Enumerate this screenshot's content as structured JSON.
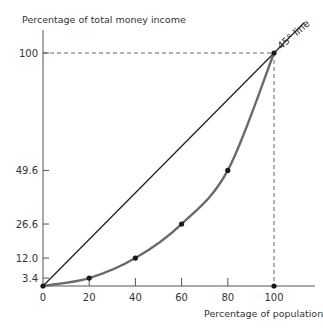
{
  "chart_data": {
    "type": "line",
    "title": "",
    "ylabel": "Percentage of total money income",
    "xlabel": "Percentage of population",
    "xlim": [
      0,
      100
    ],
    "ylim": [
      0,
      100
    ],
    "x_ticks": [
      0,
      20,
      40,
      60,
      80,
      100
    ],
    "y_ticks": [
      3.4,
      12.0,
      26.6,
      49.6,
      100
    ],
    "y_tick_labels": [
      "3.4",
      "12.0",
      "26.6",
      "49.6",
      "100"
    ],
    "x_tick_labels": [
      "0",
      "20",
      "40",
      "60",
      "80",
      "100"
    ],
    "grid": false,
    "series": [
      {
        "name": "45° line",
        "x": [
          0,
          100
        ],
        "y": [
          0,
          100
        ],
        "color": "#222222"
      },
      {
        "name": "Lorenz curve",
        "x": [
          0,
          20,
          40,
          60,
          80,
          100
        ],
        "y": [
          0,
          3.4,
          12.0,
          26.6,
          49.6,
          100
        ],
        "color": "#666666"
      }
    ],
    "annotations": [
      {
        "text": "45° line",
        "position": "near top-right end of diagonal"
      }
    ],
    "reference_lines": [
      {
        "type": "horizontal-dashed",
        "y": 100,
        "from_x": 0,
        "to_x": 100
      },
      {
        "type": "vertical-dashed",
        "x": 100,
        "from_y": 0,
        "to_y": 100
      }
    ]
  },
  "labels": {
    "y_axis_title": "Percentage of total money income",
    "x_axis_title": "Percentage of population",
    "diag_label": "45° line"
  }
}
